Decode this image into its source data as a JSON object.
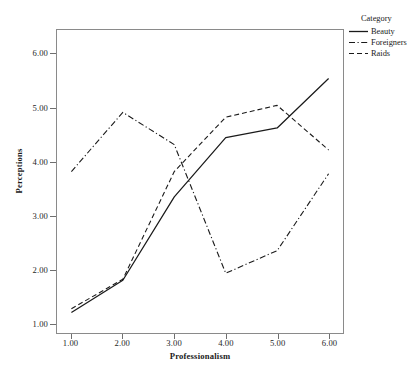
{
  "chart_data": {
    "type": "line",
    "title": "",
    "xlabel": "Professionalism",
    "ylabel": "Perceptions",
    "x": [
      1,
      2,
      3,
      4,
      5,
      6
    ],
    "xtick_labels": [
      "1.00",
      "2.00",
      "3.00",
      "4.00",
      "5.00",
      "6.00"
    ],
    "ytick_labels": [
      "1.00",
      "2.00",
      "3.00",
      "4.00",
      "5.00",
      "6.00"
    ],
    "yticks": [
      1,
      2,
      3,
      4,
      5,
      6
    ],
    "xlim": [
      0.72,
      6.28
    ],
    "ylim": [
      0.82,
      6.45
    ],
    "grid": false,
    "legend_position": "right",
    "legend_title": "Category",
    "series": [
      {
        "name": "Beauty",
        "style": "solid",
        "color": "#1a1a1a",
        "values": [
          1.2,
          1.8,
          3.35,
          4.45,
          4.63,
          5.55
        ]
      },
      {
        "name": "Foreigners",
        "style": "dash-dot",
        "color": "#1a1a1a",
        "values": [
          3.82,
          4.92,
          4.32,
          1.93,
          2.35,
          3.78
        ]
      },
      {
        "name": "Raids",
        "style": "dashed",
        "color": "#1a1a1a",
        "values": [
          1.27,
          1.82,
          3.82,
          4.83,
          5.05,
          4.22
        ]
      }
    ]
  },
  "legend": {
    "title": "Category",
    "items": [
      {
        "label": "Beauty",
        "style": "solid"
      },
      {
        "label": "Foreigners",
        "style": "dash-dot"
      },
      {
        "label": "Raids",
        "style": "dashed"
      }
    ]
  },
  "axes": {
    "x_title": "Professionalism",
    "y_title": "Perceptions"
  }
}
